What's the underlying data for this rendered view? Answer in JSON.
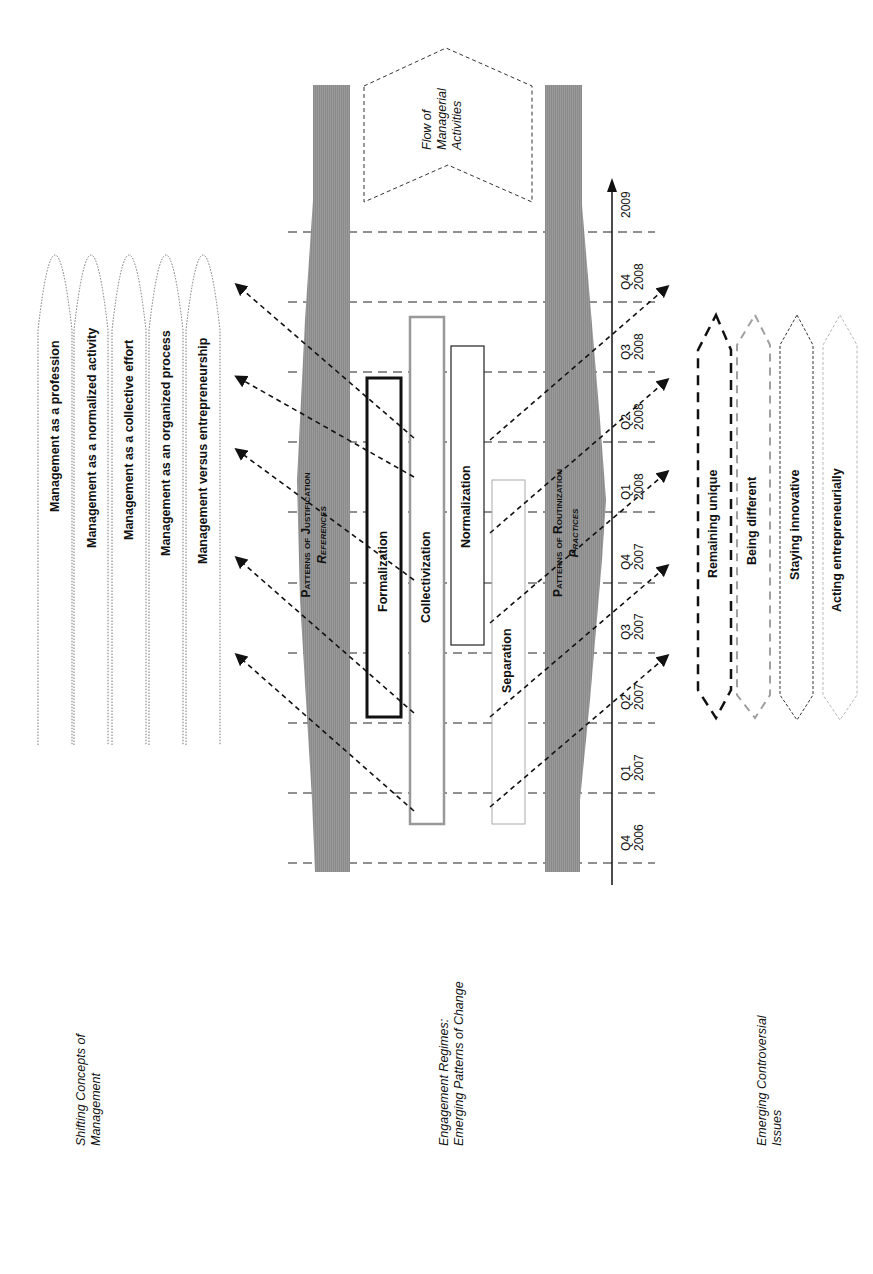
{
  "sections": {
    "concepts": {
      "line1": "Shifting Concepts of",
      "line2": "Management"
    },
    "regimes": {
      "line1": "Engagement Regimes:",
      "line2": "Emerging Patterns of Change"
    },
    "issues": {
      "line1": "Emerging Controversial",
      "line2": "Issues"
    }
  },
  "concepts": [
    "Management as a profession",
    "Management as a normalized activity",
    "Management as a collective effort",
    "Management as an organized process",
    "Management versus entrepreneurship"
  ],
  "flow": {
    "line1": "Flow of",
    "line2": "Managerial",
    "line3": "Activities"
  },
  "bands": {
    "justification": {
      "title": "Patterns of Justification",
      "subtitle": "References"
    },
    "routinization": {
      "title": "Patterns of Routinization",
      "subtitle": "Practices"
    }
  },
  "boxes": {
    "formalization": "Formalization",
    "collectivization": "Collectivization",
    "normalization": "Normalization",
    "separation": "Separation"
  },
  "timeline": {
    "end_label": "2009",
    "ticks": [
      {
        "q": "Q4",
        "year": "2008"
      },
      {
        "q": "Q3",
        "year": "2008"
      },
      {
        "q": "Q2",
        "year": "2008"
      },
      {
        "q": "Q1",
        "year": "2008"
      },
      {
        "q": "Q4",
        "year": "2007"
      },
      {
        "q": "Q3",
        "year": "2007"
      },
      {
        "q": "Q2",
        "year": "2007"
      },
      {
        "q": "Q1",
        "year": "2007"
      },
      {
        "q": "Q4",
        "year": "2006"
      }
    ]
  },
  "issues": [
    "Remaining unique",
    "Being different",
    "Staying innovative",
    "Acting entrepreneurially"
  ],
  "colors": {
    "band": "#8c8c8c",
    "ink": "#111111",
    "grey_dash": "#a0a0a0",
    "light_dash": "#c4c4c4"
  }
}
